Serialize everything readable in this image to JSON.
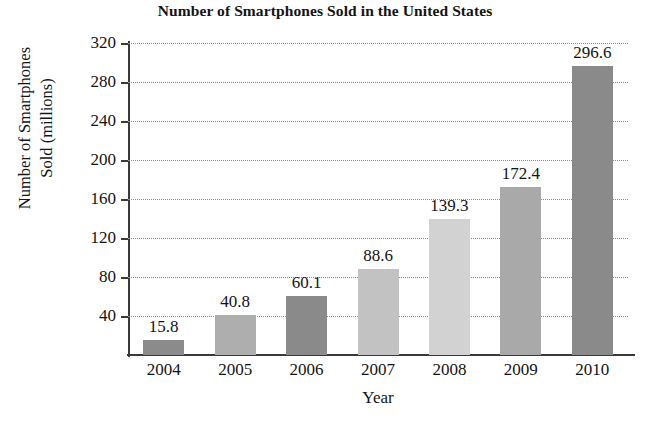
{
  "chart_data": {
    "type": "bar",
    "title": "Number of Smartphones Sold in the United States",
    "xlabel": "Year",
    "ylabel_line1": "Number of Smartphones",
    "ylabel_line2": "Sold (millions)",
    "categories": [
      "2004",
      "2005",
      "2006",
      "2007",
      "2008",
      "2009",
      "2010"
    ],
    "values": [
      15.8,
      40.8,
      60.1,
      88.6,
      139.3,
      172.4,
      296.6
    ],
    "value_labels": [
      "15.8",
      "40.8",
      "60.1",
      "88.6",
      "139.3",
      "172.4",
      "296.6"
    ],
    "bar_colors": [
      "#8b8b8b",
      "#aeaeae",
      "#8a8a8a",
      "#c2c2c2",
      "#d2d2d2",
      "#a9a9a9",
      "#8a8a8a"
    ],
    "ylim": [
      0,
      320
    ],
    "ytick_labels": [
      "40",
      "80",
      "120",
      "160",
      "200",
      "240",
      "280",
      "320"
    ],
    "ytick_values": [
      40,
      80,
      120,
      160,
      200,
      240,
      280,
      320
    ],
    "grid": true,
    "gridline_style": "dotted",
    "legend": "none",
    "axis_color": "#3a3a3a",
    "text_color": "#141414"
  }
}
